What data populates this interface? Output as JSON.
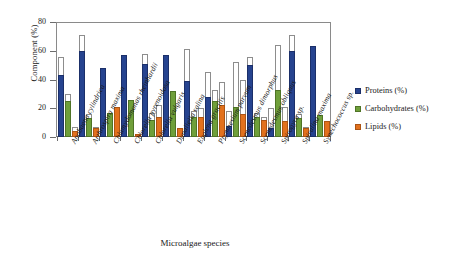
{
  "chart_data": {
    "type": "bar",
    "title": "",
    "xlabel": "Microalgae species",
    "ylabel": "Component (%)",
    "ylim": [
      0,
      80
    ],
    "yticks": [
      0,
      20,
      40,
      60,
      80
    ],
    "grid": false,
    "legend_position": "right",
    "note": "Solid bar = minimum reported value; hollow (white outlined) extension = up to maximum reported value (range).",
    "categories": [
      "Anabaena cylindrica",
      "Arthrospira maxima",
      "Chlamydomonas rheinhardii",
      "Chlorella pyrenoidosa",
      "Chlorella vulgaris",
      "Dunaliella salina",
      "Euglena gracilis",
      "Prymnesium parvum",
      "Scenedesmus dimorphus",
      "Scenedesmus obliquus",
      "Spirogyra sp.",
      "Spirulina maxima",
      "Synechococcus sp."
    ],
    "series": [
      {
        "name": "Proteins (%)",
        "color": "#26438f",
        "values_min": [
          43,
          60,
          48,
          57,
          51,
          57,
          39,
          28,
          8,
          50,
          6,
          60,
          63
        ],
        "values_max": [
          56,
          71,
          48,
          57,
          58,
          57,
          61,
          45,
          18,
          56,
          20,
          71,
          63
        ]
      },
      {
        "name": "Carbohydrates (%)",
        "color": "#6f9f3a",
        "values_min": [
          25,
          13,
          17,
          26,
          12,
          32,
          14,
          25,
          21,
          14,
          33,
          13,
          15
        ],
        "values_max": [
          30,
          16,
          17,
          26,
          17,
          32,
          18,
          33,
          52,
          17,
          64,
          16,
          15
        ]
      },
      {
        "name": "Lipids (%)",
        "color": "#e2711d",
        "values_min": [
          4,
          6,
          21,
          2,
          14,
          6,
          14,
          22,
          16,
          12,
          11,
          6,
          11
        ],
        "values_max": [
          7,
          7,
          21,
          2,
          22,
          6,
          20,
          38,
          40,
          14,
          21,
          7,
          11
        ]
      }
    ]
  },
  "legend": {
    "items": [
      {
        "label": "Proteins (%)",
        "key": "p"
      },
      {
        "label": "Carbohydrates (%)",
        "key": "c"
      },
      {
        "label": "Lipids (%)",
        "key": "l"
      }
    ]
  },
  "axes": {
    "y_title": "Component (%)",
    "x_title": "Microalgae species",
    "y_tick_labels": [
      "80",
      "60",
      "40",
      "20",
      "0"
    ]
  }
}
